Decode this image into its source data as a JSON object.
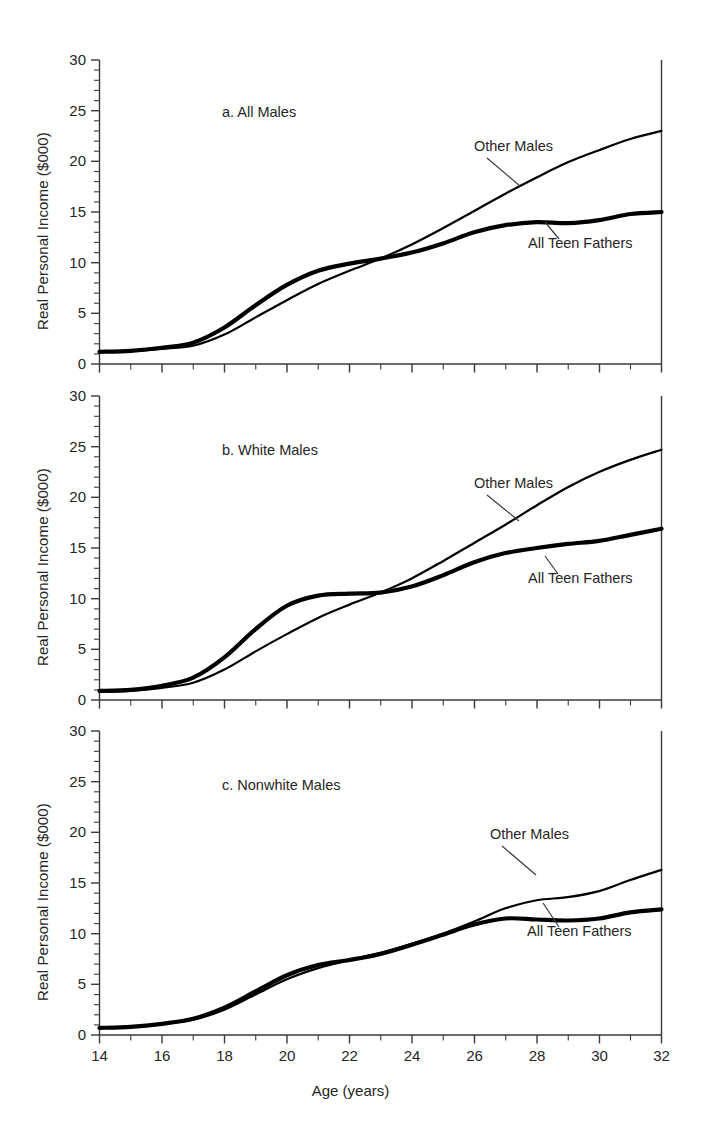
{
  "figure": {
    "axis_title_x": "Age (years)",
    "axis_title_y": "Real Personal Income ($000)",
    "xticks": [
      "14",
      "16",
      "18",
      "20",
      "22",
      "24",
      "26",
      "28",
      "30",
      "32"
    ],
    "yticks": [
      "0",
      "5",
      "10",
      "15",
      "20",
      "25",
      "30"
    ],
    "series_label_other": "Other Males",
    "series_label_fathers": "All Teen Fathers",
    "line_color": "#000000",
    "axis_color": "#3a3a3a"
  },
  "panels": [
    {
      "id": "a",
      "title": "a. All Males"
    },
    {
      "id": "b",
      "title": "b. White Males"
    },
    {
      "id": "c",
      "title": "c. Nonwhite Males"
    }
  ],
  "chart_data": {
    "type": "line",
    "xlabel": "Age (years)",
    "ylabel": "Real Personal Income ($000)",
    "xlim": [
      14,
      32
    ],
    "ylim": [
      0,
      30
    ],
    "xtick_major": [
      14,
      16,
      18,
      20,
      22,
      24,
      26,
      28,
      30,
      32
    ],
    "ytick_major": [
      0,
      5,
      10,
      15,
      20,
      25,
      30
    ],
    "minor_ticks": true,
    "grid": false,
    "legend": "inline-annotations",
    "x": [
      14,
      15,
      16,
      17,
      18,
      19,
      20,
      21,
      22,
      23,
      24,
      25,
      26,
      27,
      28,
      29,
      30,
      31,
      32
    ],
    "panels": [
      {
        "id": "a",
        "title": "a. All Males",
        "series": [
          {
            "name": "All Teen Fathers",
            "values": [
              1.2,
              1.3,
              1.6,
              2.1,
              3.6,
              5.8,
              7.8,
              9.2,
              9.9,
              10.4,
              11.0,
              11.9,
              13.0,
              13.7,
              14.0,
              13.9,
              14.2,
              14.8,
              15.0
            ]
          },
          {
            "name": "Other Males",
            "values": [
              1.2,
              1.3,
              1.5,
              1.8,
              2.9,
              4.6,
              6.3,
              7.9,
              9.2,
              10.4,
              11.8,
              13.4,
              15.1,
              16.8,
              18.4,
              19.9,
              21.1,
              22.2,
              23.0
            ]
          }
        ]
      },
      {
        "id": "b",
        "title": "b. White Males",
        "series": [
          {
            "name": "All Teen Fathers",
            "values": [
              0.9,
              1.0,
              1.4,
              2.2,
              4.2,
              7.0,
              9.3,
              10.3,
              10.5,
              10.6,
              11.2,
              12.3,
              13.6,
              14.5,
              15.0,
              15.4,
              15.7,
              16.3,
              16.9
            ]
          },
          {
            "name": "Other Males",
            "values": [
              0.8,
              0.9,
              1.2,
              1.7,
              3.0,
              4.8,
              6.5,
              8.1,
              9.4,
              10.6,
              12.0,
              13.7,
              15.5,
              17.3,
              19.2,
              21.0,
              22.5,
              23.7,
              24.7
            ]
          }
        ]
      },
      {
        "id": "c",
        "title": "c. Nonwhite Males",
        "series": [
          {
            "name": "All Teen Fathers",
            "values": [
              0.7,
              0.8,
              1.1,
              1.6,
              2.7,
              4.3,
              5.9,
              6.9,
              7.4,
              8.0,
              8.9,
              9.9,
              10.9,
              11.5,
              11.4,
              11.3,
              11.5,
              12.1,
              12.4
            ]
          },
          {
            "name": "Other Males",
            "values": [
              0.7,
              0.8,
              1.1,
              1.5,
              2.5,
              4.0,
              5.5,
              6.6,
              7.4,
              8.1,
              9.0,
              10.0,
              11.2,
              12.5,
              13.3,
              13.6,
              14.2,
              15.3,
              16.3
            ]
          }
        ]
      }
    ]
  }
}
